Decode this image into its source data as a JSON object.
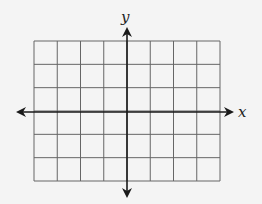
{
  "diagram": {
    "type": "coordinate-grid",
    "x_axis_label": "x",
    "y_axis_label": "y",
    "grid": {
      "columns": 8,
      "rows": 6,
      "left": 34,
      "top": 41,
      "right": 220,
      "bottom": 181
    },
    "origin": {
      "x": 127,
      "y": 112
    },
    "colors": {
      "background": "#f4f4f4",
      "grid_line": "#555555",
      "axis": "#1a1a1a"
    }
  }
}
